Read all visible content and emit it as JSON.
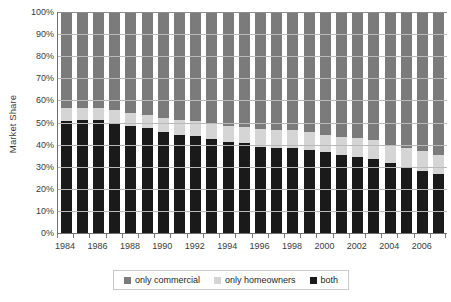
{
  "chart_data": {
    "type": "bar",
    "subtype": "stacked-percentage-column",
    "title": "",
    "subtitle": "",
    "xlabel": "",
    "ylabel": "Market Share",
    "ylim": [
      0,
      100
    ],
    "yunit": "%",
    "grid": true,
    "legend_position": "bottom",
    "categories": [
      "1984",
      "1985",
      "1986",
      "1987",
      "1988",
      "1989",
      "1990",
      "1991",
      "1992",
      "1993",
      "1994",
      "1995",
      "1996",
      "1997",
      "1998",
      "1999",
      "2000",
      "2001",
      "2002",
      "2003",
      "2004",
      "2005",
      "2006",
      "2007"
    ],
    "tick_labels": [
      "1984",
      "1986",
      "1988",
      "1990",
      "1992",
      "1994",
      "1996",
      "1998",
      "2000",
      "2002",
      "2004",
      "2006"
    ],
    "y_ticks": [
      "0%",
      "10%",
      "20%",
      "30%",
      "40%",
      "50%",
      "60%",
      "70%",
      "80%",
      "90%",
      "100%"
    ],
    "y_tick_values": [
      0,
      10,
      20,
      30,
      40,
      50,
      60,
      70,
      80,
      90,
      100
    ],
    "series": [
      {
        "name": "both",
        "color": "#1a1a1a",
        "values": [
          50.5,
          51.0,
          51.0,
          49.5,
          48.5,
          47.5,
          45.5,
          44.5,
          44.0,
          42.5,
          41.0,
          40.5,
          39.0,
          38.5,
          38.5,
          37.5,
          36.5,
          35.5,
          34.5,
          33.5,
          31.5,
          29.5,
          28.0,
          26.5
        ]
      },
      {
        "name": "only homeowners",
        "color": "#d5d5d5",
        "values": [
          6.0,
          5.5,
          5.5,
          6.0,
          6.0,
          6.0,
          6.5,
          6.5,
          6.5,
          7.0,
          7.5,
          7.5,
          8.0,
          8.0,
          8.0,
          8.0,
          8.0,
          8.0,
          8.5,
          8.5,
          8.5,
          9.0,
          9.0,
          9.0
        ]
      },
      {
        "name": "only commercial",
        "color": "#7b7b7b",
        "values": [
          43.5,
          43.5,
          43.5,
          44.5,
          45.5,
          46.5,
          48.0,
          49.0,
          49.5,
          50.5,
          51.5,
          52.0,
          53.0,
          53.5,
          53.5,
          54.5,
          55.5,
          56.5,
          57.0,
          58.0,
          60.0,
          61.5,
          63.0,
          64.5
        ]
      }
    ]
  },
  "legend": {
    "items": [
      {
        "label": "only commercial",
        "color": "#7b7b7b"
      },
      {
        "label": "only homeowners",
        "color": "#d5d5d5"
      },
      {
        "label": "both",
        "color": "#1a1a1a"
      }
    ]
  },
  "axes": {
    "y_title": "Market Share"
  }
}
